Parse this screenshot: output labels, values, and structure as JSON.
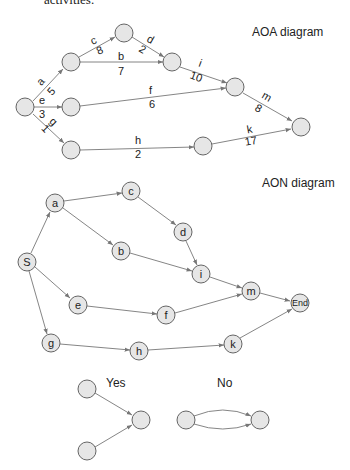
{
  "header_text": "activities.",
  "aoa": {
    "title": "AOA diagram",
    "activities": [
      {
        "name": "a",
        "duration": "5"
      },
      {
        "name": "b",
        "duration": "7"
      },
      {
        "name": "c",
        "duration": "8"
      },
      {
        "name": "d",
        "duration": "2"
      },
      {
        "name": "e",
        "duration": "3"
      },
      {
        "name": "f",
        "duration": "6"
      },
      {
        "name": "g",
        "duration": "1"
      },
      {
        "name": "h",
        "duration": "2"
      },
      {
        "name": "i",
        "duration": "10"
      },
      {
        "name": "k",
        "duration": "17"
      },
      {
        "name": "m",
        "duration": "8"
      }
    ]
  },
  "aon": {
    "title": "AON diagram",
    "nodes": [
      "S",
      "a",
      "b",
      "c",
      "d",
      "e",
      "f",
      "g",
      "h",
      "i",
      "k",
      "m",
      "End"
    ]
  },
  "examples": {
    "yes_label": "Yes",
    "no_label": "No"
  }
}
